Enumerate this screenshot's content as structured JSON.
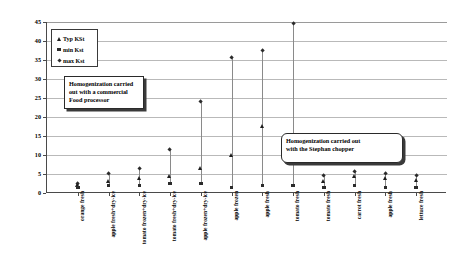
{
  "chart_data": {
    "type": "scatter",
    "title": "",
    "xlabel": "",
    "ylabel": "Kst (kg)",
    "ylim": [
      0,
      45
    ],
    "yticks": [
      0,
      5,
      10,
      15,
      20,
      25,
      30,
      35,
      40,
      45
    ],
    "grid": true,
    "legend_position": "upper-left",
    "categories": [
      "orange fresh",
      "apple fresh+dry-ice",
      "tomato frozen+dry-ice",
      "tomato fresh+dry-ice",
      "apple frozen+dry-ice",
      "apple frozen",
      "apple fresh",
      "tomato fresh",
      "tomato fresh",
      "carrot fresh",
      "apple fresh",
      "lettuce fresh"
    ],
    "series": [
      {
        "name": "Typ KSt",
        "marker": "triangle",
        "values": [
          2.0,
          3.0,
          4.0,
          4.5,
          6.5,
          10.0,
          17.5,
          11.0,
          3.0,
          4.5,
          4.0,
          3.5
        ]
      },
      {
        "name": "min Kst",
        "marker": "square",
        "values": [
          1.5,
          2.0,
          2.0,
          2.5,
          2.5,
          1.5,
          2.0,
          2.0,
          1.5,
          2.0,
          1.5,
          1.5
        ]
      },
      {
        "name": "max Kst",
        "marker": "diamond",
        "values": [
          2.5,
          5.0,
          6.5,
          11.5,
          24.0,
          35.5,
          37.5,
          44.5,
          4.5,
          5.5,
          5.0,
          4.5
        ]
      }
    ],
    "annotations": [
      {
        "id": "callout-1",
        "lines": [
          "Homogenization carried",
          "out with a commercial",
          "Food processor"
        ]
      },
      {
        "id": "callout-2",
        "lines": [
          "Homogenization carried out",
          "with the Stephan chopper"
        ]
      }
    ]
  }
}
